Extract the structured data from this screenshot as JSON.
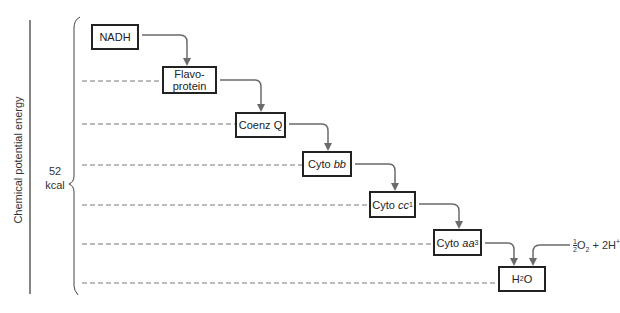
{
  "axis": {
    "label": "Chemical potential energy"
  },
  "energy_span": {
    "value": "52",
    "unit": "kcal"
  },
  "steps": [
    {
      "id": "nadh",
      "label": "NADH"
    },
    {
      "id": "flavoprotein",
      "label_line1": "Flavo-",
      "label_line2": "protein"
    },
    {
      "id": "coenzq",
      "label": "Coenz Q"
    },
    {
      "id": "cytobb",
      "prefix": "Cyto ",
      "italic": "bb"
    },
    {
      "id": "cytocc1",
      "prefix": "Cyto ",
      "italic": "cc",
      "sub": "1"
    },
    {
      "id": "cytoaa3",
      "prefix": "Cyto ",
      "italic": "aa",
      "sub": "3"
    },
    {
      "id": "h2o",
      "prefix": "H",
      "sub": "2",
      "suffix": "O"
    }
  ],
  "oxygen_input": {
    "frac_num": "1",
    "frac_den": "2",
    "o": "O",
    "o_sub": "2",
    "plus": " + 2H",
    "sup": "+"
  },
  "colors": {
    "arrow": "#6b6b6b",
    "box_border": "#222222",
    "dash": "#777777"
  }
}
